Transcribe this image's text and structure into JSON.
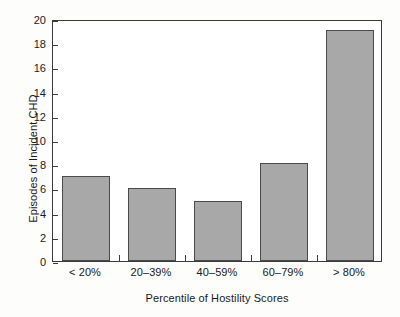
{
  "chart_data": {
    "type": "bar",
    "title": "",
    "xlabel": "Percentile of Hostility Scores",
    "ylabel": "Episodes of Incident CHD",
    "categories": [
      "< 20%",
      "20–39%",
      "40–59%",
      "60–79%",
      "> 80%"
    ],
    "values": [
      7,
      6,
      5,
      8.1,
      19.1
    ],
    "ylim": [
      0,
      20
    ],
    "yticks": [
      0,
      2,
      4,
      6,
      8,
      10,
      12,
      14,
      16,
      18,
      20
    ],
    "ytick_labels": [
      "0",
      "2",
      "4",
      "6",
      "8",
      "10",
      "12",
      "14",
      "16",
      "18",
      "20"
    ],
    "grid": false,
    "legend": null,
    "bar_color": "#a8a8a8",
    "bar_edge_color": "#4a4a4a",
    "axis_color": "#3b3b3b",
    "background_color": "#ffffff"
  }
}
